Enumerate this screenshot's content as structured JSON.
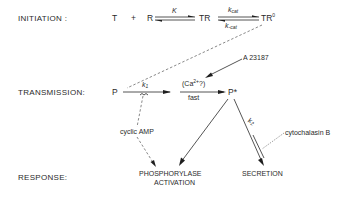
{
  "stages": {
    "initiation": "INITIATION :",
    "transmission": "TRANSMISSION:",
    "response": "RESPONSE:"
  },
  "initiation": {
    "T": "T",
    "plus": "+",
    "R": "R",
    "K": "K",
    "TR": "TR",
    "kcat": "k",
    "kcat_sub": "cat",
    "k_minus_cat": "k",
    "k_minus_cat_sub": "-cat",
    "TR0": "TR",
    "TR0_sup": "0"
  },
  "transmission": {
    "P": "P",
    "k1": "k",
    "k1_sub": "1",
    "ca_label_open": "(Ca",
    "ca_sup": "2+",
    "ca_label_close": "?)",
    "fast": "fast",
    "P_star": "P*",
    "A23187": "A 23187",
    "k2": "k",
    "k2_sub": "2",
    "cyclic_amp": "cyclic AMP",
    "cytochalasin": "cytochalasin B"
  },
  "response": {
    "phosphorylase_line1": "PHOSPHORYLASE",
    "phosphorylase_line2": "ACTIVATION",
    "secretion": "SECRETION"
  },
  "colors": {
    "ink": "#2a2a2a",
    "background": "#ffffff"
  }
}
